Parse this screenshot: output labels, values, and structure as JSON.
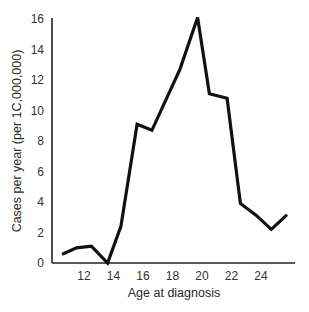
{
  "chart_data": {
    "type": "line",
    "title": "",
    "xlabel": "Age at diagnosis",
    "ylabel": "Cases per year (per 1C,000,000)",
    "xlim": [
      10,
      26
    ],
    "ylim": [
      0,
      16
    ],
    "x_ticks": [
      12,
      14,
      16,
      18,
      20,
      22,
      24
    ],
    "y_ticks": [
      0,
      2,
      4,
      6,
      8,
      10,
      12,
      14,
      16
    ],
    "grid": false,
    "legend": null,
    "series": [
      {
        "name": "Cases",
        "color": "#111111",
        "x": [
          10.6,
          11.5,
          12.5,
          13.6,
          14.5,
          15.6,
          16.6,
          18.5,
          19.7,
          20.5,
          21.7,
          22.6,
          23.7,
          24.7,
          25.7
        ],
        "values": [
          0.6,
          1.0,
          1.1,
          0.0,
          2.4,
          9.1,
          8.7,
          12.7,
          16.1,
          11.1,
          10.8,
          3.9,
          3.1,
          2.2,
          3.1
        ]
      }
    ]
  },
  "layout": {
    "plot_left": 52,
    "plot_bottom": 263,
    "plot_top": 19,
    "x_axis_end": 295,
    "x_origin_value": 12,
    "x_origin_px": 84,
    "px_per_x": 14.75,
    "px_per_y": 15.25
  }
}
